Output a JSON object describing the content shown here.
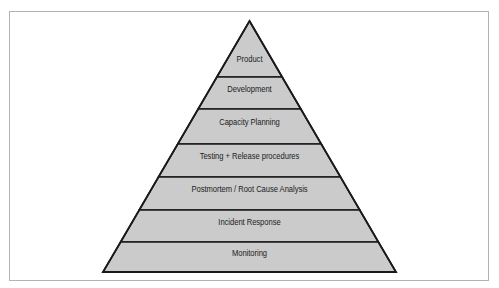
{
  "figure": {
    "kind": "pyramid-diagram",
    "background_color": "#ffffff",
    "frame_color": "#b3b3b3",
    "band_fill_color": "#cbcbcb",
    "outline_color": "#1a1a1a",
    "label_color": "#1c1c1c",
    "apex": {
      "x": 249.5,
      "y": 21
    },
    "base_left": {
      "x": 103,
      "y": 272
    },
    "base_right": {
      "x": 396,
      "y": 272
    },
    "divider_y": [
      77,
      109,
      144,
      177,
      210,
      242
    ],
    "tiers": [
      {
        "label": "Product",
        "label_y": 60
      },
      {
        "label": "Development",
        "label_y": 90
      },
      {
        "label": "Capacity Planning",
        "label_y": 123
      },
      {
        "label": "Testing + Release procedures",
        "label_y": 157
      },
      {
        "label": "Postmortem / Root Cause Analysis",
        "label_y": 190
      },
      {
        "label": "Incident Response",
        "label_y": 223
      },
      {
        "label": "Monitoring",
        "label_y": 254
      }
    ]
  }
}
